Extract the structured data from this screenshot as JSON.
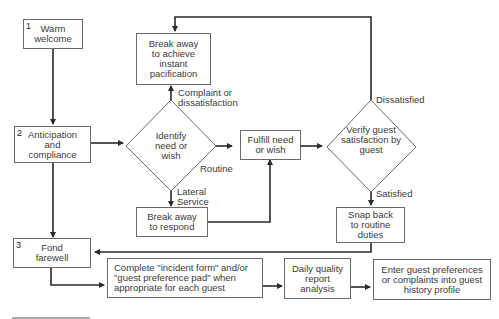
{
  "diagram": {
    "type": "flowchart",
    "steps": {
      "warm_welcome": {
        "number": "1",
        "label": "Warm welcome"
      },
      "anticipation": {
        "number": "2",
        "label": "Anticipation and compliance"
      },
      "fond_farewell": {
        "number": "3",
        "label": "Fond farewell"
      }
    },
    "nodes": {
      "break_away_pacification": "Break away to achieve instant pacification",
      "identify_need": "Identify need or wish",
      "fulfill_need": "Fulfill need or wish",
      "verify_satisfaction": "Verify guest satisfaction by guest",
      "break_away_respond": "Break away to respond",
      "snap_back": "Snap back to routine duties",
      "complete_form": "Complete \"incident form\" and/or \"guest preference pad\" when appropriate for each guest",
      "daily_report": "Daily quality report analysis",
      "enter_preferences": "Enter guest preferences or complaints into guest history profile"
    },
    "edge_labels": {
      "complaint": "Complaint or dissatisfaction",
      "routine": "Routine",
      "lateral": "Lateral Service",
      "dissatisfied": "Dissatisfied",
      "satisfied": "Satisfied"
    },
    "line_color": "#2a2a2a",
    "box_border_color": "#6a6a6a"
  }
}
